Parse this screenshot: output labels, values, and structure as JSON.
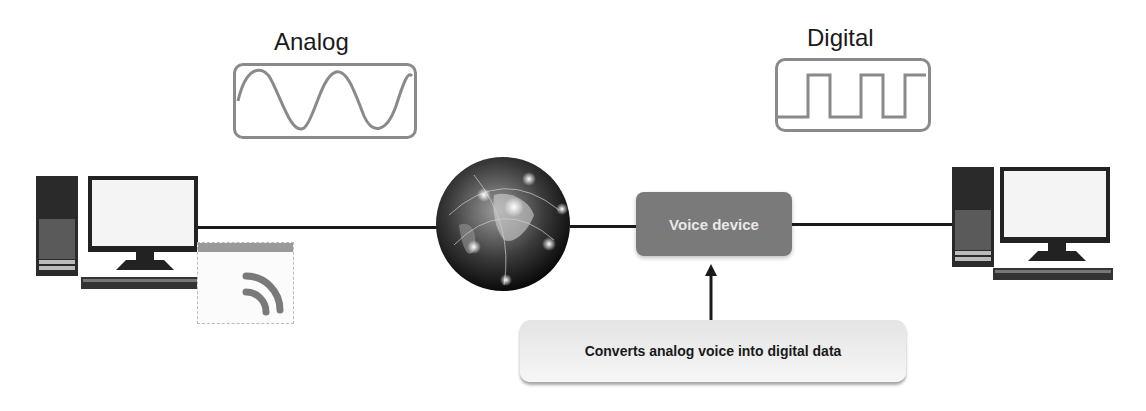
{
  "analog": {
    "label": "Analog"
  },
  "digital": {
    "label": "Digital"
  },
  "voice_device": {
    "label": "Voice device"
  },
  "callout": {
    "text": "Converts analog voice into digital data"
  },
  "colors": {
    "line": "#1a1a1a",
    "wave_stroke": "#8a8a8a",
    "voice_device_fill": "#7a7a7a",
    "callout_fill": "#ececec"
  }
}
